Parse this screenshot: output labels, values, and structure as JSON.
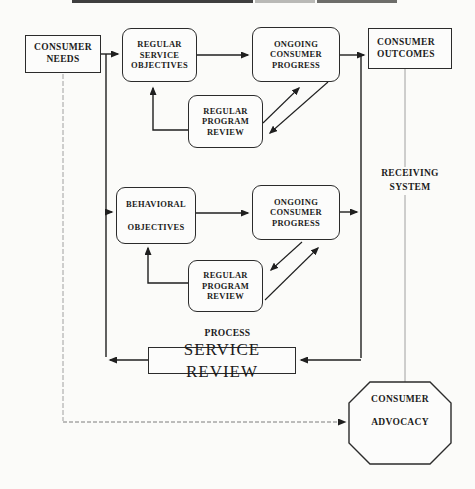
{
  "nodes": {
    "consumer_needs": {
      "line1": "CONSUMER",
      "line2": "NEEDS"
    },
    "regular_service_objectives": {
      "line1": "REGULAR",
      "line2": "SERVICE",
      "line3": "OBJECTIVES"
    },
    "ongoing_consumer_progress_1": {
      "line1": "ONGOING",
      "line2": "CONSUMER",
      "line3": "PROGRESS"
    },
    "consumer_outcomes": {
      "line1": "CONSUMER",
      "line2": "OUTCOMES"
    },
    "regular_program_review_1": {
      "line1": "REGULAR",
      "line2": "PROGRAM",
      "line3": "REVIEW"
    },
    "behavioral_objectives": {
      "line1": "BEHAVIORAL",
      "line2": "OBJECTIVES"
    },
    "ongoing_consumer_progress_2": {
      "line1": "ONGOING",
      "line2": "CONSUMER",
      "line3": "PROGRESS"
    },
    "regular_program_review_2": {
      "line1": "REGULAR",
      "line2": "PROGRAM",
      "line3": "REVIEW"
    },
    "service_review": {
      "label": "SERVICE REVIEW"
    },
    "consumer_advocacy": {
      "line1": "CONSUMER",
      "line2": "ADVOCACY"
    }
  },
  "labels": {
    "process": "PROCESS",
    "receiving_system": {
      "line1": "RECEIVING",
      "line2": "SYSTEM"
    }
  },
  "colors": {
    "line": "#1f1f1f",
    "gray_line": "#a0a0a0",
    "border": "#2b2b2b",
    "background": "#fbfbf9",
    "text": "#1c1c1c"
  }
}
